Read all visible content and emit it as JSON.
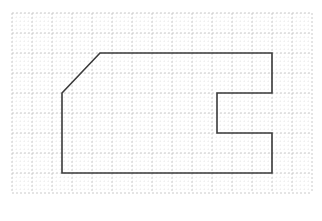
{
  "figure": {
    "title": "Grid Polygon Figure",
    "description": "A closed polygon outline drawn on a dotted graph-paper grid",
    "canvas": {
      "width": 322,
      "height": 221,
      "background": "#ffffff"
    }
  },
  "grid": {
    "major_color": "#bdbdbd",
    "minor_color": "#d8d8d8",
    "major_spacing": 20,
    "minor_spacing": 4,
    "origin_x": 12,
    "origin_y": 13,
    "columns": 15,
    "rows": 9,
    "right_edge": 312,
    "bottom_edge": 193,
    "style": "dotted",
    "major_dash": "2 2",
    "minor_dash": "1 3",
    "major_width": 0.8,
    "minor_width": 0.5
  },
  "shape": {
    "name": "L-shaped polygon with chamfered top-left corner",
    "stroke_color": "#3a3a3a",
    "stroke_width": 1.6,
    "fill": "none",
    "closed": true,
    "vertex_count": 9,
    "points": [
      {
        "label": "A",
        "x": 100,
        "y": 53
      },
      {
        "label": "B",
        "x": 272,
        "y": 53
      },
      {
        "label": "C",
        "x": 272,
        "y": 93
      },
      {
        "label": "D",
        "x": 217,
        "y": 93
      },
      {
        "label": "E",
        "x": 217,
        "y": 133
      },
      {
        "label": "F",
        "x": 272,
        "y": 133
      },
      {
        "label": "G",
        "x": 272,
        "y": 173
      },
      {
        "label": "H",
        "x": 62,
        "y": 173
      },
      {
        "label": "I",
        "x": 62,
        "y": 93
      }
    ],
    "points_attr": "100,53 272,53 272,93 217,93 217,133 272,133 272,173 62,173 62,93"
  },
  "chart_data": {
    "type": "line",
    "title": "Grid Polygon Figure",
    "xlabel": "",
    "ylabel": "",
    "grid": true,
    "legend": "none",
    "xlim": [
      0,
      15
    ],
    "ylim": [
      0,
      9
    ],
    "series": [
      {
        "name": "polygon-outline",
        "x": [
          4.4,
          13.0,
          13.0,
          10.25,
          10.25,
          13.0,
          13.0,
          2.5,
          2.5,
          4.4
        ],
        "y": [
          7.0,
          7.0,
          5.0,
          5.0,
          3.0,
          3.0,
          1.0,
          1.0,
          5.0,
          7.0
        ]
      }
    ]
  }
}
